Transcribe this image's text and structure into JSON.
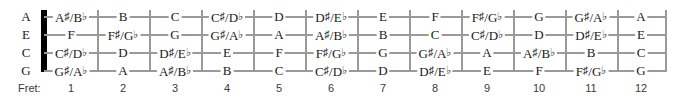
{
  "diagram": {
    "instrument_tuning": "GCEA",
    "axis_label": "Fret:",
    "strings": [
      "A",
      "E",
      "C",
      "G"
    ],
    "fret_numbers": [
      "1",
      "2",
      "3",
      "4",
      "5",
      "6",
      "7",
      "8",
      "9",
      "10",
      "11",
      "12"
    ],
    "colors": {
      "nut": "#000000",
      "line": "#9a9a9a",
      "text": "#1a1a1a",
      "fret_number_text": "#3a3a3a",
      "background": "#ffffff"
    },
    "rows": [
      {
        "string": "A",
        "notes": [
          "A♯/B♭",
          "B",
          "C",
          "C♯/D♭",
          "D",
          "D♯/E♭",
          "E",
          "F",
          "F♯/G♭",
          "G",
          "G♯/A♭",
          "A"
        ]
      },
      {
        "string": "E",
        "notes": [
          "F",
          "F♯/G♭",
          "G",
          "G♯/A♭",
          "A",
          "A♯/B♭",
          "B",
          "C",
          "C♯/D♭",
          "D",
          "D♯/E♭",
          "E"
        ]
      },
      {
        "string": "C",
        "notes": [
          "C♯/D♭",
          "D",
          "D♯/E♭",
          "E",
          "F",
          "F♯/G♭",
          "G",
          "G♯/A♭",
          "A",
          "A♯/B♭",
          "B",
          "C"
        ]
      },
      {
        "string": "G",
        "notes": [
          "G♯/A♭",
          "A",
          "A♯/B♭",
          "B",
          "C",
          "C♯/D♭",
          "D",
          "D♯/E♭",
          "E",
          "F",
          "F♯/G♭",
          "G"
        ]
      }
    ]
  }
}
